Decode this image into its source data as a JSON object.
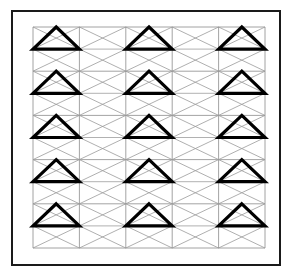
{
  "figure": {
    "canvas": {
      "width": 292,
      "height": 276,
      "background": "#ffffff"
    },
    "outer_frame": {
      "name": "outer-border",
      "x": 12,
      "y": 11,
      "width": 268,
      "height": 254,
      "stroke": "#1a1a1a",
      "stroke_width": 2,
      "fill": "none"
    },
    "grid": {
      "x": 33,
      "y": 27,
      "width": 232,
      "height": 221,
      "columns": 5,
      "rows": 5,
      "cell_width": 46.4,
      "cell_height": 44.2,
      "line_color": "#8c8c8c",
      "line_width": 0.8
    },
    "diagonals": {
      "name": "gray-diagonal-lattice",
      "color": "#9a9a9a",
      "width": 0.8,
      "description": "X crossings in every half-cell forming a diamond lattice"
    },
    "triangles": {
      "name": "bold-triangles",
      "color": "#000000",
      "width": 3.2,
      "orientation": "point-up",
      "description": "Bold outlined isoceles triangles occupying the top half of each marked cell",
      "occupied_columns": [
        1,
        3,
        5
      ],
      "occupied_rows": [
        1,
        2,
        3,
        4,
        5
      ],
      "cells": [
        {
          "row": 1,
          "col": 1
        },
        {
          "row": 1,
          "col": 3
        },
        {
          "row": 1,
          "col": 5
        },
        {
          "row": 2,
          "col": 1
        },
        {
          "row": 2,
          "col": 3
        },
        {
          "row": 2,
          "col": 5
        },
        {
          "row": 3,
          "col": 1
        },
        {
          "row": 3,
          "col": 3
        },
        {
          "row": 3,
          "col": 5
        },
        {
          "row": 4,
          "col": 1
        },
        {
          "row": 4,
          "col": 3
        },
        {
          "row": 4,
          "col": 5
        },
        {
          "row": 5,
          "col": 1
        },
        {
          "row": 5,
          "col": 3
        },
        {
          "row": 5,
          "col": 5
        }
      ],
      "count": 15
    }
  }
}
